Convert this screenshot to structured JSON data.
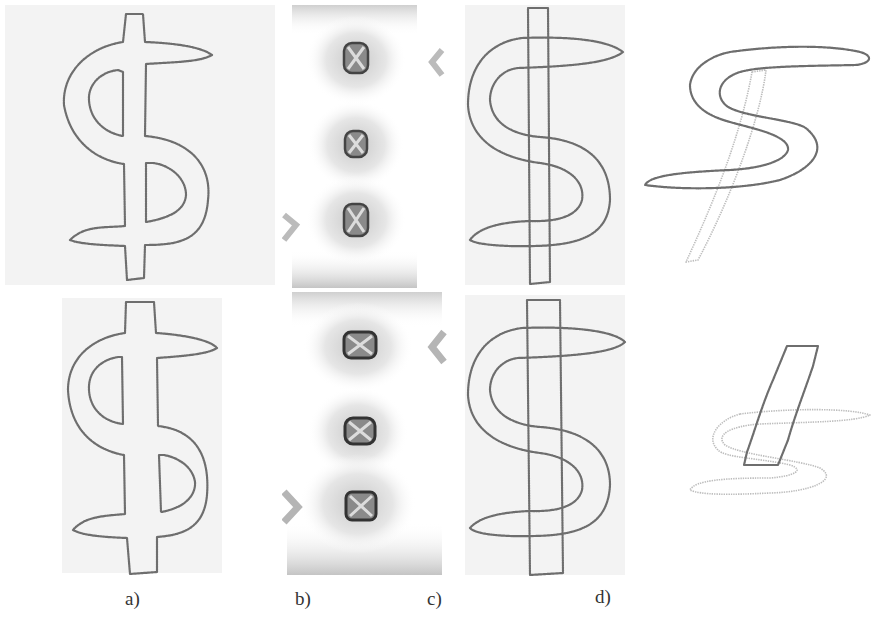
{
  "figure": {
    "panels": [
      {
        "id": "a",
        "label": "a)",
        "description": "dollar-sign mesh outlines (top and bottom)"
      },
      {
        "id": "b",
        "label": "b)",
        "description": "stress/deformation field with three square features per row"
      },
      {
        "id": "c",
        "label": "c)",
        "description": "overlapping S curve and vertical bar outlines"
      },
      {
        "id": "d",
        "label": "d)",
        "description": "separated S and bar components"
      }
    ],
    "colors": {
      "outline": "#6e6e6e",
      "faint_outline": "#bdbdbd",
      "background": "#ffffff",
      "texture": "#f3f3f3"
    }
  }
}
